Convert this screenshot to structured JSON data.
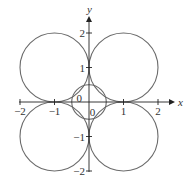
{
  "figure": {
    "x_axis": {
      "label": "x",
      "range": [
        -2,
        2
      ],
      "ticks": [
        -2,
        -1,
        1,
        2
      ],
      "tick_labels": [
        "−2",
        "−1",
        "1",
        "2"
      ]
    },
    "y_axis": {
      "label": "y",
      "range": [
        -2,
        2
      ],
      "ticks": [
        -2,
        -1,
        1,
        2
      ],
      "tick_labels": [
        "−2",
        "−1",
        "1",
        "2"
      ]
    },
    "circles": [
      {
        "name": "top-right-circle",
        "cx": 1,
        "cy": 1,
        "r": 1
      },
      {
        "name": "top-left-circle",
        "cx": -1,
        "cy": 1,
        "r": 1
      },
      {
        "name": "bottom-left-circle",
        "cx": -1,
        "cy": -1,
        "r": 1
      },
      {
        "name": "bottom-right-circle",
        "cx": 1,
        "cy": -1,
        "r": 1
      },
      {
        "name": "center-circle",
        "cx": 0,
        "cy": 0,
        "r": 0.5
      }
    ],
    "annotations": [
      {
        "name": "zero-label-upper-left",
        "text": "0",
        "x": -0.28,
        "y": 0.12
      },
      {
        "name": "zero-label-lower-right",
        "text": "0",
        "x": 0.1,
        "y": -0.3
      }
    ],
    "colors": {
      "curve": "#6b6b6b",
      "axis": "#222222"
    }
  }
}
